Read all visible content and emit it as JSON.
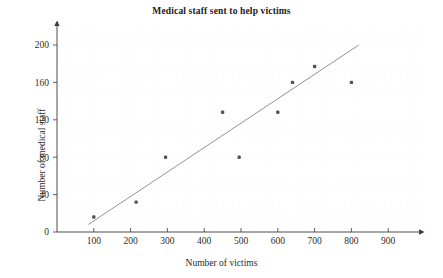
{
  "chart_data": {
    "type": "scatter",
    "title": "Medical staff sent to help victims",
    "xlabel": "Number of victims",
    "ylabel": "Number of medical staff",
    "xlim": [
      0,
      960
    ],
    "ylim": [
      0,
      215
    ],
    "xticks": [
      100,
      200,
      300,
      400,
      500,
      600,
      700,
      800,
      900
    ],
    "yticks": [
      0,
      40,
      80,
      120,
      160,
      200
    ],
    "grid": "faint",
    "legend": "none",
    "marker_color": "#555555",
    "line_color": "#777777",
    "axis_color": "#444444",
    "series": [
      {
        "name": "Medical staff vs victims",
        "points": [
          {
            "x": 100,
            "y": 16
          },
          {
            "x": 215,
            "y": 32
          },
          {
            "x": 295,
            "y": 80
          },
          {
            "x": 450,
            "y": 128
          },
          {
            "x": 495,
            "y": 80
          },
          {
            "x": 600,
            "y": 128
          },
          {
            "x": 640,
            "y": 160
          },
          {
            "x": 700,
            "y": 177
          },
          {
            "x": 800,
            "y": 160
          }
        ]
      }
    ],
    "trend_line": {
      "name": "line of best fit",
      "x_start": 85,
      "y_start": 8,
      "x_end": 820,
      "y_end": 200
    }
  },
  "ticks": {
    "x": [
      "100",
      "200",
      "300",
      "400",
      "500",
      "600",
      "700",
      "800",
      "900"
    ],
    "y": [
      "0",
      "40",
      "80",
      "120",
      "160",
      "200"
    ]
  }
}
